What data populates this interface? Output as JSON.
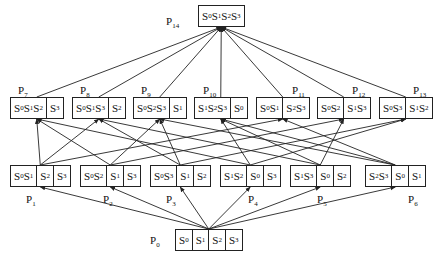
{
  "diagram": {
    "type": "lattice",
    "nodes": [
      {
        "id": "P0",
        "label": "P0",
        "cells": [
          "S0",
          "S1",
          "S2",
          "S3"
        ],
        "level": 0
      },
      {
        "id": "P1",
        "label": "P1",
        "cells": [
          "S0S1",
          "S2",
          "S3"
        ],
        "level": 1
      },
      {
        "id": "P2",
        "label": "P2",
        "cells": [
          "S0S2",
          "S1",
          "S3"
        ],
        "level": 1
      },
      {
        "id": "P3",
        "label": "P3",
        "cells": [
          "S0S3",
          "S1",
          "S2"
        ],
        "level": 1
      },
      {
        "id": "P4",
        "label": "P4",
        "cells": [
          "S1S2",
          "S0",
          "S3"
        ],
        "level": 1
      },
      {
        "id": "P5",
        "label": "P5",
        "cells": [
          "S1S3",
          "S0",
          "S2"
        ],
        "level": 1
      },
      {
        "id": "P6",
        "label": "P6",
        "cells": [
          "S2S3",
          "S0",
          "S1"
        ],
        "level": 1
      },
      {
        "id": "P7",
        "label": "P7",
        "cells": [
          "S0S1S2",
          "S3"
        ],
        "level": 2
      },
      {
        "id": "P8",
        "label": "P8",
        "cells": [
          "S0S1S3",
          "S2"
        ],
        "level": 2
      },
      {
        "id": "P9",
        "label": "P9",
        "cells": [
          "S0S2S3",
          "S1"
        ],
        "level": 2
      },
      {
        "id": "P10",
        "label": "P10",
        "cells": [
          "S1S2S3",
          "S0"
        ],
        "level": 2
      },
      {
        "id": "P11",
        "label": "P11",
        "cells": [
          "S0S1",
          "S2S3"
        ],
        "level": 2
      },
      {
        "id": "P12",
        "label": "P12",
        "cells": [
          "S0S2",
          "S1S3"
        ],
        "level": 2
      },
      {
        "id": "P13",
        "label": "P13",
        "cells": [
          "S0S3",
          "S1S2"
        ],
        "level": 2
      },
      {
        "id": "P14",
        "label": "P14",
        "cells": [
          "S0S1S2S3"
        ],
        "level": 3
      }
    ],
    "edges": [
      [
        "P0",
        "P1"
      ],
      [
        "P0",
        "P2"
      ],
      [
        "P0",
        "P3"
      ],
      [
        "P0",
        "P4"
      ],
      [
        "P0",
        "P5"
      ],
      [
        "P0",
        "P6"
      ],
      [
        "P1",
        "P7"
      ],
      [
        "P1",
        "P8"
      ],
      [
        "P1",
        "P11"
      ],
      [
        "P2",
        "P7"
      ],
      [
        "P2",
        "P9"
      ],
      [
        "P2",
        "P12"
      ],
      [
        "P3",
        "P8"
      ],
      [
        "P3",
        "P9"
      ],
      [
        "P3",
        "P13"
      ],
      [
        "P4",
        "P7"
      ],
      [
        "P4",
        "P10"
      ],
      [
        "P4",
        "P13"
      ],
      [
        "P5",
        "P8"
      ],
      [
        "P5",
        "P10"
      ],
      [
        "P5",
        "P12"
      ],
      [
        "P6",
        "P9"
      ],
      [
        "P6",
        "P10"
      ],
      [
        "P6",
        "P11"
      ],
      [
        "P7",
        "P14"
      ],
      [
        "P8",
        "P14"
      ],
      [
        "P9",
        "P14"
      ],
      [
        "P10",
        "P14"
      ],
      [
        "P11",
        "P14"
      ],
      [
        "P12",
        "P14"
      ],
      [
        "P13",
        "P14"
      ]
    ]
  }
}
